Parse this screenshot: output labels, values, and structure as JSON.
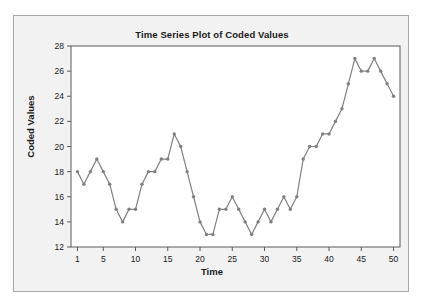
{
  "chart_data": {
    "type": "line",
    "title": "Time Series Plot of Coded Values",
    "xlabel": "Time",
    "ylabel": "Coded Values",
    "x": [
      1,
      2,
      3,
      4,
      5,
      6,
      7,
      8,
      9,
      10,
      11,
      12,
      13,
      14,
      15,
      16,
      17,
      18,
      19,
      20,
      21,
      22,
      23,
      24,
      25,
      26,
      27,
      28,
      29,
      30,
      31,
      32,
      33,
      34,
      35,
      36,
      37,
      38,
      39,
      40,
      41,
      42,
      43,
      44,
      45,
      46,
      47,
      48,
      49,
      50
    ],
    "values": [
      18,
      17,
      18,
      19,
      18,
      17,
      15,
      14,
      15,
      15,
      17,
      18,
      18,
      19,
      19,
      21,
      20,
      18,
      16,
      14,
      13,
      13,
      15,
      15,
      16,
      15,
      14,
      13,
      14,
      15,
      14,
      15,
      16,
      15,
      16,
      19,
      20,
      20,
      21,
      21,
      22,
      23,
      25,
      27,
      26,
      26,
      27,
      26,
      25,
      24
    ],
    "xlim": [
      0,
      51
    ],
    "ylim": [
      12,
      28
    ],
    "xticks": [
      1,
      5,
      10,
      15,
      20,
      25,
      30,
      35,
      40,
      45,
      50
    ],
    "yticks": [
      12,
      14,
      16,
      18,
      20,
      22,
      24,
      26,
      28
    ],
    "xtick_labels": [
      "1",
      "5",
      "10",
      "15",
      "20",
      "25",
      "30",
      "35",
      "40",
      "45",
      "50"
    ],
    "ytick_labels": [
      "12",
      "14",
      "16",
      "18",
      "20",
      "22",
      "24",
      "26",
      "28"
    ],
    "grid": false,
    "legend": null,
    "series_color": "#808080",
    "marker": "circle",
    "plot_background": "#ffffff",
    "panel_background": "#f2f2f2"
  }
}
